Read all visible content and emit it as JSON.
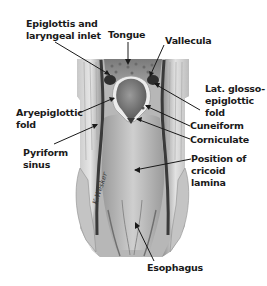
{
  "figure": {
    "type": "anatomical-illustration"
  },
  "labels": {
    "epiglottis": "Epiglottis and\nlaryngeal inlet",
    "tongue": "Tongue",
    "vallecula": "Vallecula",
    "lat_glosso": "Lat. glosso-\nepiglottic\nfold",
    "aryepiglottic": "Aryepiglottic\nfold",
    "cuneiform": "Cuneiform",
    "corniculate": "Corniculate",
    "pyriform": "Pyriform\nsinus",
    "cricoid": "Position of\ncricoid\nlamina",
    "esophagus": "Esophagus"
  },
  "signature": "K.Wesker",
  "colors": {
    "background": "#ffffff",
    "label_text": "#1a1a1a",
    "leader_line": "#1a1a1a",
    "tissue_light": "#d9d9d9",
    "tissue_mid": "#a8a8a8",
    "tissue_dark": "#4a4a4a"
  }
}
